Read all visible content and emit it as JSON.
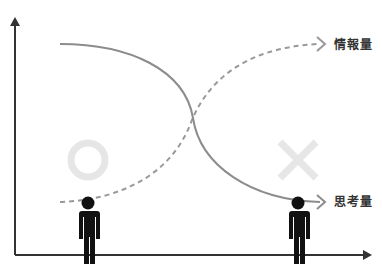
{
  "diagram": {
    "labels": {
      "information": "情報量",
      "thinking": "思考量"
    },
    "symbols": {
      "good": "circle-mark",
      "bad": "cross-mark"
    },
    "colors": {
      "axis": "#333333",
      "solid_curve": "#8c8c8c",
      "dashed_curve": "#999999",
      "mark": "#e6e6e6",
      "person": "#111111",
      "label": "#333333"
    }
  }
}
